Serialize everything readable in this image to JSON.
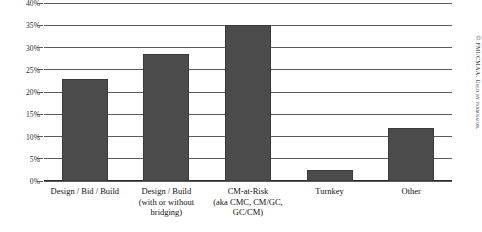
{
  "chart_data": {
    "type": "bar",
    "title": "",
    "subtitle": "",
    "xlabel": "",
    "ylabel": "",
    "ylim": [
      0,
      40
    ],
    "ytick_values": [
      0,
      5,
      10,
      15,
      20,
      25,
      30,
      35,
      40
    ],
    "ytick_labels": [
      "0%",
      "5%",
      "10%",
      "15%",
      "20%",
      "25%",
      "30%",
      "35%",
      "40%"
    ],
    "grid": true,
    "grid_axis": "y",
    "legend": false,
    "legend_position": "none",
    "bar_color": "#4b4b4b",
    "categories": [
      "Design / Bid / Build",
      "Design / Build (with or without bridging)",
      "CM-at-Risk (aka CMC, CM/GC, GC/CM)",
      "Turnkey",
      "Other"
    ],
    "category_label_lines": [
      [
        "Design / Bid / Build"
      ],
      [
        "Design / Build",
        "(with or without",
        "bridging)"
      ],
      [
        "CM-at-Risk",
        "(aka CMC, CM/GC,",
        "GC/CM)"
      ],
      [
        "Turnkey"
      ],
      [
        "Other"
      ]
    ],
    "values": [
      23,
      28.5,
      35,
      2.5,
      12
    ],
    "value_labels": [
      "23%",
      "28.5%",
      "35%",
      "2.5%",
      "12%"
    ]
  },
  "credit": {
    "text": "© FMI/CMAA. Used by permission."
  }
}
